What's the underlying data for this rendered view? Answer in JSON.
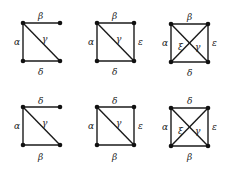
{
  "diagram": {
    "colors": {
      "edge": "#1a1a1a",
      "node": "#111111",
      "label": "#222222",
      "background": "#ffffff"
    },
    "panels": [
      {
        "id": "top-1",
        "labels": {
          "top": "β",
          "left": "α",
          "diag1": "γ",
          "bottom": "δ"
        }
      },
      {
        "id": "top-2",
        "labels": {
          "top": "β",
          "left": "α",
          "diag1": "γ",
          "right": "ε",
          "bottom": "δ"
        }
      },
      {
        "id": "top-3",
        "labels": {
          "top": "β",
          "left": "α",
          "diag2": "ξ",
          "diag1": "γ",
          "right": "ε",
          "bottom": "δ"
        }
      },
      {
        "id": "bottom-1",
        "labels": {
          "top": "δ",
          "left": "α",
          "diag1": "γ",
          "bottom": "β"
        }
      },
      {
        "id": "bottom-2",
        "labels": {
          "top": "δ",
          "left": "α",
          "diag1": "γ",
          "right": "ε",
          "bottom": "β"
        }
      },
      {
        "id": "bottom-3",
        "labels": {
          "top": "δ",
          "left": "α",
          "diag2": "ξ",
          "diag1": "γ",
          "right": "ε",
          "bottom": "β"
        }
      }
    ]
  }
}
